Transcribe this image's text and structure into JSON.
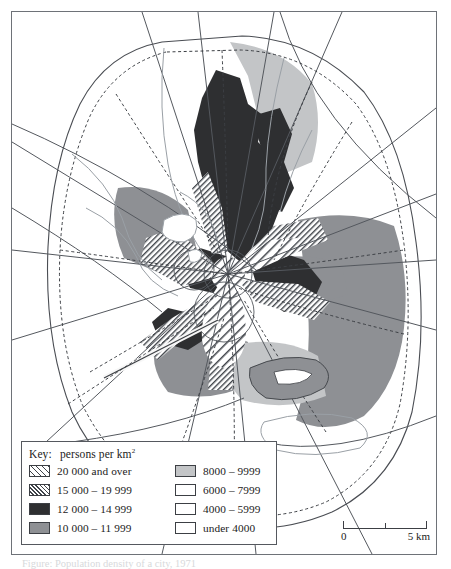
{
  "map": {
    "title_hidden": "",
    "legend": {
      "title_key": "Key:",
      "title_text": "persons per km",
      "title_exponent": "2",
      "column_left": [
        {
          "label": "20 000 and over",
          "fill": "hatch-wide",
          "swatch_name": "swatch-20000-and-over"
        },
        {
          "label": "15 000 – 19 999",
          "fill": "hatch-tight",
          "swatch_name": "swatch-15000-19999"
        },
        {
          "label": "12 000 – 14 999",
          "fill": "black",
          "swatch_name": "swatch-12000-14999"
        },
        {
          "label": "10 000 – 11 999",
          "fill": "darkgrey",
          "swatch_name": "swatch-10000-11999"
        }
      ],
      "column_right": [
        {
          "label": "8000 – 9999",
          "fill": "midgrey",
          "swatch_name": "swatch-8000-9999"
        },
        {
          "label": "6000 – 7999",
          "fill": "white",
          "swatch_name": "swatch-6000-7999"
        },
        {
          "label": "4000 – 5999",
          "fill": "white",
          "swatch_name": "swatch-4000-5999"
        },
        {
          "label": "under 4000",
          "fill": "white",
          "swatch_name": "swatch-under-4000"
        }
      ]
    },
    "scale": {
      "start_label": "0",
      "end_label": "5 km",
      "total_km": 5,
      "midpoint_km": 2.5
    },
    "caption": "Figure: Population density of a city, 1971",
    "colors": {
      "class_20000_plus": "#3f4349",
      "class_15000_19999": "#3f4349",
      "class_12000_14999": "#2e2f31",
      "class_10000_11999": "#8e9094",
      "class_8000_9999": "#c3c5c7",
      "class_under_8000": "#ffffff",
      "frame": "#6e7278",
      "road": "#54585e",
      "boundary_dashed": "#3c3f44",
      "river": "#9aa0a6"
    }
  }
}
